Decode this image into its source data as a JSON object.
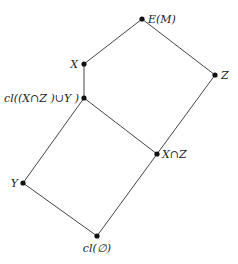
{
  "diagram": {
    "type": "lattice",
    "line_color": "#444444",
    "node_color": "#111111",
    "nodes": [
      {
        "id": "top",
        "label": "E(M)",
        "x": 142,
        "y": 19,
        "lx": 148,
        "ly": 23,
        "anchor": "start"
      },
      {
        "id": "x",
        "label": "X",
        "x": 84,
        "y": 64,
        "lx": 78,
        "ly": 68,
        "anchor": "end"
      },
      {
        "id": "z",
        "label": "Z",
        "x": 215,
        "y": 75,
        "lx": 221,
        "ly": 79,
        "anchor": "start"
      },
      {
        "id": "cl_xz_y",
        "label": "cl((X∩Z )∪Y )",
        "x": 84,
        "y": 98,
        "lx": 79,
        "ly": 102,
        "anchor": "end"
      },
      {
        "id": "x_cap_z",
        "label": "X∩Z",
        "x": 157,
        "y": 154,
        "lx": 162,
        "ly": 158,
        "anchor": "start"
      },
      {
        "id": "y",
        "label": "Y",
        "x": 23,
        "y": 183,
        "lx": 18,
        "ly": 187,
        "anchor": "end"
      },
      {
        "id": "bottom",
        "label": "cl(∅)",
        "x": 97,
        "y": 236,
        "lx": 97,
        "ly": 252,
        "anchor": "middle"
      }
    ],
    "edges": [
      [
        "top",
        "x"
      ],
      [
        "top",
        "z"
      ],
      [
        "x",
        "cl_xz_y"
      ],
      [
        "z",
        "x_cap_z"
      ],
      [
        "cl_xz_y",
        "x_cap_z"
      ],
      [
        "cl_xz_y",
        "y"
      ],
      [
        "y",
        "bottom"
      ],
      [
        "x_cap_z",
        "bottom"
      ]
    ]
  }
}
